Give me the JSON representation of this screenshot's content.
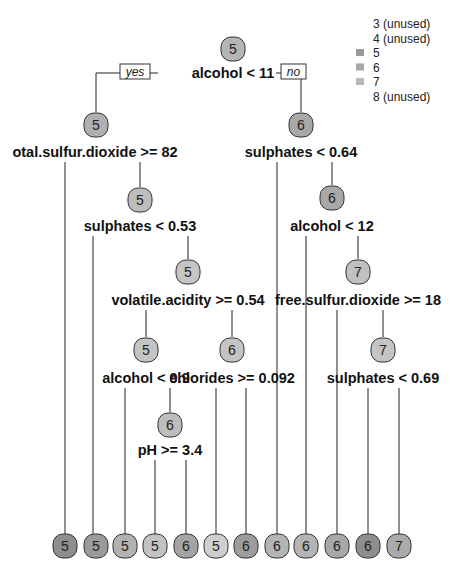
{
  "diagram": {
    "type": "decision-tree",
    "legend": {
      "items": [
        {
          "label": "3 (unused)",
          "swatch": null
        },
        {
          "label": "4 (unused)",
          "swatch": null
        },
        {
          "label": "5",
          "swatch": "#9a9a9a"
        },
        {
          "label": "6",
          "swatch": "#a8a8a8"
        },
        {
          "label": "7",
          "swatch": "#b8b8b8"
        },
        {
          "label": "8 (unused)",
          "swatch": null
        }
      ]
    },
    "root_labels": {
      "yes": "yes",
      "no": "no"
    },
    "nodes": [
      {
        "id": "n1",
        "value": "5",
        "x": 233,
        "y": 49,
        "fill": "#b5b5b5",
        "split": "alcohol < 11",
        "split_y": 78
      },
      {
        "id": "n2",
        "value": "5",
        "x": 96,
        "y": 125,
        "fill": "#b0b0b0",
        "split": "otal.sulfur.dioxide >= 82",
        "split_x": 95,
        "split_y": 157
      },
      {
        "id": "n3",
        "value": "6",
        "x": 301,
        "y": 125,
        "fill": "#a8a8a8",
        "split": "sulphates < 0.64",
        "split_y": 157
      },
      {
        "id": "n4",
        "value": "5",
        "x": 140,
        "y": 200,
        "fill": "#bdbdbd",
        "split": "sulphates < 0.53",
        "split_y": 231
      },
      {
        "id": "n5",
        "value": "6",
        "x": 332,
        "y": 198,
        "fill": "#a8a8a8",
        "split": "alcohol < 12",
        "split_y": 231
      },
      {
        "id": "n6",
        "value": "5",
        "x": 188,
        "y": 272,
        "fill": "#c4c4c4",
        "split": "volatile.acidity >= 0.54",
        "split_y": 305
      },
      {
        "id": "n7",
        "value": "7",
        "x": 358,
        "y": 272,
        "fill": "#c0c0c0",
        "split": "free.sulfur.dioxide >= 18",
        "split_y": 305
      },
      {
        "id": "n8",
        "value": "5",
        "x": 146,
        "y": 350,
        "fill": "#c4c4c4",
        "split": "alcohol < 9.9",
        "split_y": 383
      },
      {
        "id": "n9",
        "value": "6",
        "x": 232,
        "y": 350,
        "fill": "#c4c4c4",
        "split": "chlorides >= 0.092",
        "split_y": 383
      },
      {
        "id": "n10",
        "value": "7",
        "x": 383,
        "y": 350,
        "fill": "#c4c4c4",
        "split": "sulphates < 0.69",
        "split_y": 383
      },
      {
        "id": "n11",
        "value": "6",
        "x": 170,
        "y": 425,
        "fill": "#bdbdbd",
        "split": "pH >= 3.4",
        "split_y": 455
      }
    ],
    "leaves": [
      {
        "value": "5",
        "x": 65,
        "fill": "#8e8e8e"
      },
      {
        "value": "5",
        "x": 96,
        "fill": "#9a9a9a"
      },
      {
        "value": "5",
        "x": 125,
        "fill": "#b2b2b2"
      },
      {
        "value": "5",
        "x": 155,
        "fill": "#c2c2c2"
      },
      {
        "value": "6",
        "x": 186,
        "fill": "#a4a4a4"
      },
      {
        "value": "5",
        "x": 216,
        "fill": "#cfcfcf"
      },
      {
        "value": "6",
        "x": 246,
        "fill": "#9c9c9c"
      },
      {
        "value": "6",
        "x": 277,
        "fill": "#b4b4b4"
      },
      {
        "value": "6",
        "x": 306,
        "fill": "#b4b4b4"
      },
      {
        "value": "6",
        "x": 337,
        "fill": "#a8a8a8"
      },
      {
        "value": "6",
        "x": 368,
        "fill": "#8e8e8e"
      },
      {
        "value": "7",
        "x": 399,
        "fill": "#aaaaaa"
      }
    ],
    "leaf_y": 546
  }
}
